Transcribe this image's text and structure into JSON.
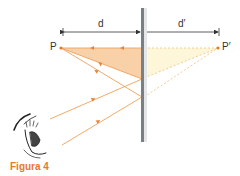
{
  "figure": {
    "caption": "Figura 4",
    "top_fragment": "Figure ...",
    "labels": {
      "object": "P",
      "image": "P′",
      "object_distance": "d",
      "image_distance": "d′"
    },
    "colors": {
      "ray": "#f0a05a",
      "object_fill": "#f7c99a",
      "image_fill": "#fdf6d8",
      "mirror": "#7a7f85",
      "caption": "#e8782a",
      "dimension": "#333333"
    }
  }
}
